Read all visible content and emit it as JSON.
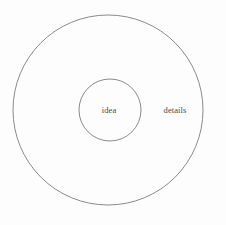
{
  "diagram": {
    "type": "concentric-circles",
    "background_color": "#fdfdfd",
    "stroke_color": "#7d7d7d",
    "text_color": "#4a4a4a",
    "outer_circle": {
      "label": "details",
      "center_x": 108,
      "center_y": 110,
      "radius": 95,
      "stroke_width": 0.9,
      "fill": "none",
      "label_x": 175,
      "label_y": 110
    },
    "inner_circle": {
      "label": "idea",
      "center_x": 110,
      "center_y": 110,
      "radius": 31,
      "stroke_width": 0.9,
      "fill": "none",
      "label_x": 109,
      "label_y": 110
    }
  }
}
